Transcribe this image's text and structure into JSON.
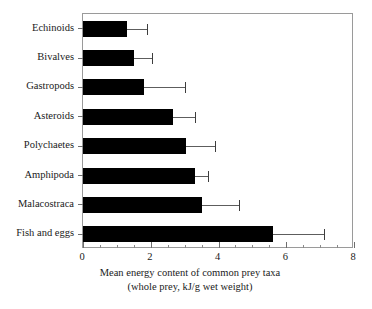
{
  "chart_data": {
    "type": "bar",
    "orientation": "horizontal",
    "title": "",
    "xlabel": "Mean energy content of common prey taxa (whole prey, kJ/g wet weight)",
    "xlabel_line1": "Mean energy content of common prey taxa",
    "xlabel_line2": "(whole prey, kJ/g wet weight)",
    "ylabel": "",
    "xlim": [
      0,
      8
    ],
    "ylim": null,
    "grid": false,
    "legend": null,
    "bar_color": "#000000",
    "error_color": "#5d5d5d",
    "frame_color": "#9a9a9a",
    "x_major_ticks": [
      0,
      2,
      4,
      6,
      8
    ],
    "x_major_tick_labels": [
      "0",
      "2",
      "4",
      "6",
      "8"
    ],
    "x_minor_tick_step": 0.5,
    "categories": [
      "Echinoids",
      "Bivalves",
      "Gastropods",
      "Asteroids",
      "Polychaetes",
      "Amphipoda",
      "Malacostraca",
      "Fish and eggs"
    ],
    "values": [
      1.3,
      1.5,
      1.8,
      2.65,
      3.05,
      3.3,
      3.5,
      5.6
    ],
    "error_high": [
      1.9,
      2.05,
      3.0,
      3.3,
      3.9,
      3.7,
      4.6,
      7.1
    ],
    "error_low": [
      1.3,
      1.5,
      1.8,
      2.65,
      3.05,
      3.3,
      3.5,
      5.6
    ],
    "series": [
      {
        "name": "Mean energy content",
        "values": [
          1.3,
          1.5,
          1.8,
          2.65,
          3.05,
          3.3,
          3.5,
          5.6
        ]
      }
    ],
    "units": "kJ/g wet weight",
    "annotations": []
  }
}
